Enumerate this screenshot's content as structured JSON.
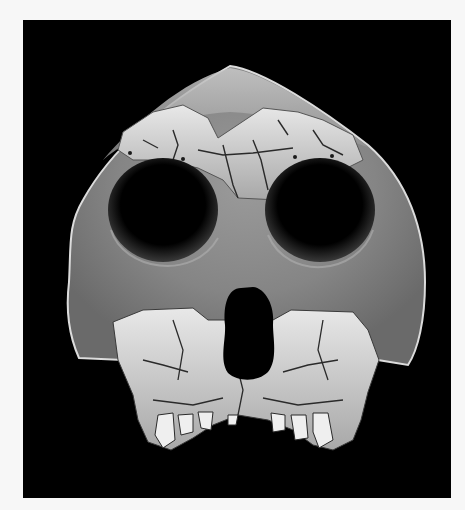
{
  "image": {
    "subject": "Fossil hominin skull (partial cranium with reconstruction), frontal view",
    "background_color": "#000000",
    "border_color": "#f7f7f7",
    "features": [
      "reconstructed smooth grey brow and cheek regions",
      "fragmented fossil frontal bone with cracks",
      "two large dark orbits",
      "dark nasal aperture",
      "fossil maxilla with upper teeth"
    ]
  },
  "colors": {
    "cast_light": "#bdbdbd",
    "cast_mid": "#8e8e8e",
    "cast_dark": "#5a5a5a",
    "fossil_light": "#e6e6e6",
    "fossil_mid": "#b5b5b5",
    "void": "#000000"
  }
}
